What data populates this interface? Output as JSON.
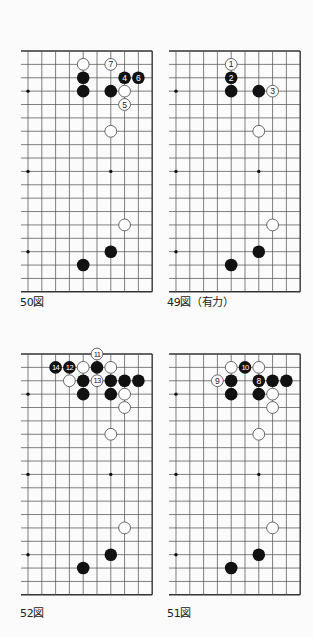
{
  "colors": {
    "line": "#555555",
    "edge": "#333333",
    "black": "#111111",
    "white_fill": "#ffffff",
    "white_stroke": "#444444",
    "star": "#111111"
  },
  "grid": {
    "cols": 10,
    "rows": 18,
    "dx": 13.8,
    "dy": 13.38,
    "left_ext": 7
  },
  "star_points": [
    [
      0,
      3
    ],
    [
      6,
      3
    ],
    [
      0,
      9
    ],
    [
      6,
      9
    ],
    [
      0,
      15
    ],
    [
      6,
      15
    ]
  ],
  "diagrams": [
    {
      "id": "d50",
      "caption": "50図",
      "origin": [
        28,
        51
      ],
      "caption_pos": [
        20,
        293
      ],
      "stones": [
        {
          "c": "w",
          "k": 4,
          "r": 1
        },
        {
          "c": "w",
          "k": 6,
          "r": 1,
          "n": "7"
        },
        {
          "c": "b",
          "k": 4,
          "r": 2
        },
        {
          "c": "b",
          "k": 7,
          "r": 2,
          "n": "4"
        },
        {
          "c": "b",
          "k": 8,
          "r": 2,
          "n": "6"
        },
        {
          "c": "b",
          "k": 4,
          "r": 3
        },
        {
          "c": "b",
          "k": 6,
          "r": 3
        },
        {
          "c": "w",
          "k": 7,
          "r": 3
        },
        {
          "c": "w",
          "k": 7,
          "r": 4,
          "n": "5"
        },
        {
          "c": "w",
          "k": 6,
          "r": 6
        },
        {
          "c": "w",
          "k": 7,
          "r": 13
        },
        {
          "c": "b",
          "k": 6,
          "r": 15
        },
        {
          "c": "b",
          "k": 4,
          "r": 16
        }
      ]
    },
    {
      "id": "d49",
      "caption": "49図（有力）",
      "origin": [
        176,
        51
      ],
      "caption_pos": [
        167,
        293
      ],
      "stones": [
        {
          "c": "w",
          "k": 4,
          "r": 1,
          "n": "1"
        },
        {
          "c": "b",
          "k": 4,
          "r": 2,
          "n": "2"
        },
        {
          "c": "b",
          "k": 4,
          "r": 3
        },
        {
          "c": "b",
          "k": 6,
          "r": 3
        },
        {
          "c": "w",
          "k": 7,
          "r": 3,
          "n": "3"
        },
        {
          "c": "w",
          "k": 6,
          "r": 6
        },
        {
          "c": "w",
          "k": 7,
          "r": 13
        },
        {
          "c": "b",
          "k": 6,
          "r": 15
        },
        {
          "c": "b",
          "k": 4,
          "r": 16
        }
      ]
    },
    {
      "id": "d52",
      "caption": "52図",
      "origin": [
        28,
        354
      ],
      "caption_pos": [
        20,
        604
      ],
      "stones": [
        {
          "c": "w",
          "k": 5,
          "r": 0,
          "n": "11"
        },
        {
          "c": "b",
          "k": 2,
          "r": 1,
          "n": "14"
        },
        {
          "c": "b",
          "k": 3,
          "r": 1,
          "n": "12"
        },
        {
          "c": "w",
          "k": 4,
          "r": 1
        },
        {
          "c": "b",
          "k": 5,
          "r": 1
        },
        {
          "c": "w",
          "k": 6,
          "r": 1
        },
        {
          "c": "w",
          "k": 3,
          "r": 2
        },
        {
          "c": "b",
          "k": 4,
          "r": 2
        },
        {
          "c": "w",
          "k": 5,
          "r": 2,
          "n": "13"
        },
        {
          "c": "b",
          "k": 6,
          "r": 2
        },
        {
          "c": "b",
          "k": 7,
          "r": 2
        },
        {
          "c": "b",
          "k": 8,
          "r": 2
        },
        {
          "c": "b",
          "k": 4,
          "r": 3
        },
        {
          "c": "b",
          "k": 6,
          "r": 3
        },
        {
          "c": "w",
          "k": 7,
          "r": 3
        },
        {
          "c": "w",
          "k": 7,
          "r": 4
        },
        {
          "c": "w",
          "k": 6,
          "r": 6
        },
        {
          "c": "w",
          "k": 7,
          "r": 13
        },
        {
          "c": "b",
          "k": 6,
          "r": 15
        },
        {
          "c": "b",
          "k": 4,
          "r": 16
        }
      ]
    },
    {
      "id": "d51",
      "caption": "51図",
      "origin": [
        176,
        354
      ],
      "caption_pos": [
        167,
        604
      ],
      "stones": [
        {
          "c": "w",
          "k": 4,
          "r": 1
        },
        {
          "c": "b",
          "k": 5,
          "r": 1,
          "n": "10"
        },
        {
          "c": "w",
          "k": 6,
          "r": 1
        },
        {
          "c": "w",
          "k": 3,
          "r": 2,
          "n": "9"
        },
        {
          "c": "b",
          "k": 4,
          "r": 2
        },
        {
          "c": "b",
          "k": 6,
          "r": 2,
          "n": "8"
        },
        {
          "c": "b",
          "k": 7,
          "r": 2
        },
        {
          "c": "b",
          "k": 8,
          "r": 2
        },
        {
          "c": "b",
          "k": 4,
          "r": 3
        },
        {
          "c": "b",
          "k": 6,
          "r": 3
        },
        {
          "c": "w",
          "k": 7,
          "r": 3
        },
        {
          "c": "w",
          "k": 7,
          "r": 4
        },
        {
          "c": "w",
          "k": 6,
          "r": 6
        },
        {
          "c": "w",
          "k": 7,
          "r": 13
        },
        {
          "c": "b",
          "k": 6,
          "r": 15
        },
        {
          "c": "b",
          "k": 4,
          "r": 16
        }
      ]
    }
  ]
}
